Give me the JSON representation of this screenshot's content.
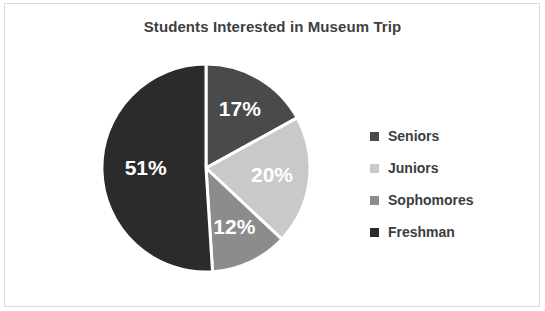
{
  "chart_data": {
    "type": "pie",
    "title": "Students Interested in Museum Trip",
    "categories": [
      "Seniors",
      "Juniors",
      "Sophomores",
      "Freshman"
    ],
    "values": [
      17,
      20,
      12,
      51
    ],
    "value_labels": [
      "17%",
      "20%",
      "12%",
      "51%"
    ],
    "colors": [
      "#4a4a4a",
      "#c9c9c9",
      "#8c8c8c",
      "#2b2b2b"
    ],
    "legend_position": "right",
    "start_angle_deg": 0,
    "direction": "clockwise",
    "slice_separator_color": "#ffffff",
    "label_color": "#ffffff",
    "unit": "%"
  },
  "frame": {
    "border_color": "#dcdcdc",
    "background": "#ffffff"
  }
}
